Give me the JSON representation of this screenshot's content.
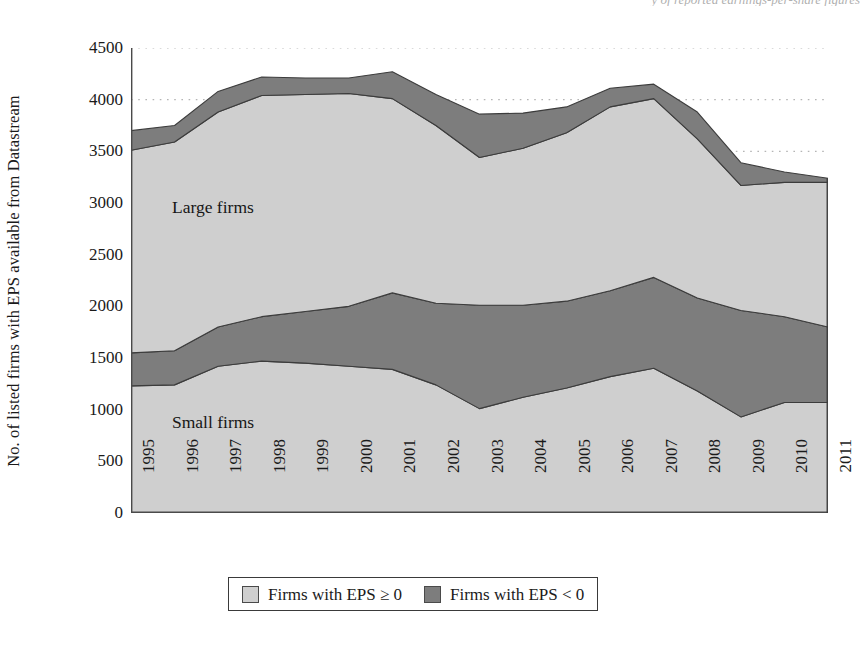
{
  "figure": {
    "top_cutoff_text": "y of reported earnings-per-share figures"
  },
  "axes": {
    "ylabel": "No. of listed firms with EPS available from Datastream",
    "xlabel": "",
    "yticks": [
      "0",
      "500",
      "1000",
      "1500",
      "2000",
      "2500",
      "3000",
      "3500",
      "4000",
      "4500"
    ],
    "xticks": [
      "1995",
      "1996",
      "1997",
      "1998",
      "1999",
      "2000",
      "2001",
      "2002",
      "2003",
      "2004",
      "2005",
      "2006",
      "2007",
      "2008",
      "2009",
      "2010",
      "2011"
    ]
  },
  "annotations": [
    {
      "name": "large-firms",
      "text": "Large firms"
    },
    {
      "name": "small-firms",
      "text": "Small firms"
    }
  ],
  "legend": {
    "position": "bottom-center",
    "items": [
      {
        "label": "Firms with EPS ≥ 0",
        "color": "#cfcfcf"
      },
      {
        "label": "Firms with EPS < 0",
        "color": "#7d7d7d"
      }
    ]
  },
  "colors": {
    "eps_positive": "#cfcfcf",
    "eps_negative": "#7d7d7d",
    "outline": "#3c3c3c",
    "gridline": "#b5b5b5",
    "axis": "#4a4a4a",
    "background": "#ffffff"
  },
  "chart_data": {
    "type": "area",
    "title": "",
    "subtitle": "",
    "xlabel": "",
    "ylabel": "No. of listed firms with EPS available from Datastream",
    "ylim": [
      0,
      4500
    ],
    "ytick_step": 500,
    "grid": "horizontal-dotted",
    "stacked": true,
    "legend_position": "bottom-center",
    "x": [
      "1995",
      "1996",
      "1997",
      "1998",
      "1999",
      "2000",
      "2001",
      "2002",
      "2003",
      "2004",
      "2005",
      "2006",
      "2007",
      "2008",
      "2009",
      "2010",
      "2011"
    ],
    "series": [
      {
        "name": "Small firms — Firms with EPS ≥ 0",
        "group": "Small firms",
        "legend": "Firms with EPS ≥ 0",
        "color": "#cfcfcf",
        "values": [
          1230,
          1240,
          1420,
          1470,
          1450,
          1420,
          1390,
          1240,
          1010,
          1120,
          1210,
          1320,
          1400,
          1180,
          930,
          1070,
          1070
        ]
      },
      {
        "name": "Small firms — Firms with EPS < 0",
        "group": "Small firms",
        "legend": "Firms with EPS < 0",
        "color": "#7d7d7d",
        "values": [
          320,
          330,
          380,
          430,
          500,
          580,
          740,
          790,
          1000,
          890,
          840,
          830,
          880,
          900,
          1030,
          830,
          730
        ]
      },
      {
        "name": "Large firms — Firms with EPS ≥ 0",
        "group": "Large firms",
        "legend": "Firms with EPS ≥ 0",
        "color": "#cfcfcf",
        "values": [
          1960,
          2020,
          2080,
          2140,
          2100,
          2060,
          1880,
          1720,
          1430,
          1520,
          1630,
          1780,
          1730,
          1540,
          1210,
          1300,
          1400
        ]
      },
      {
        "name": "Large firms — Firms with EPS < 0",
        "group": "Large firms",
        "legend": "Firms with EPS < 0",
        "color": "#7d7d7d",
        "values": [
          190,
          160,
          200,
          180,
          160,
          150,
          260,
          300,
          420,
          340,
          250,
          180,
          140,
          260,
          220,
          100,
          40
        ]
      }
    ],
    "cumulative_boundaries": {
      "small_eps_positive_top": [
        1230,
        1240,
        1420,
        1470,
        1450,
        1420,
        1390,
        1240,
        1010,
        1120,
        1210,
        1320,
        1400,
        1180,
        930,
        1070,
        1070
      ],
      "small_total_top": [
        1550,
        1570,
        1800,
        1900,
        1950,
        2000,
        2130,
        2030,
        2010,
        2010,
        2050,
        2150,
        2280,
        2080,
        1960,
        1900,
        1800
      ],
      "large_eps_positive_top": [
        3510,
        3590,
        3880,
        4040,
        4050,
        4060,
        4010,
        3750,
        3440,
        3530,
        3680,
        3930,
        4010,
        3620,
        3170,
        3200,
        3200
      ],
      "grand_total_top": [
        3700,
        3750,
        4080,
        4220,
        4210,
        4210,
        4270,
        4050,
        3860,
        3870,
        3930,
        4110,
        4150,
        3880,
        3390,
        3300,
        3240
      ]
    }
  }
}
